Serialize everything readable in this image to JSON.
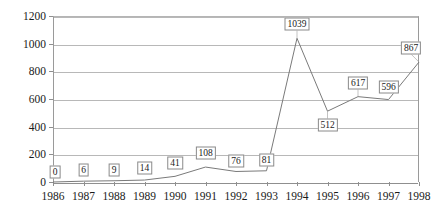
{
  "chart_data": {
    "type": "line",
    "title": "",
    "xlabel": "",
    "ylabel": "Number of Articles",
    "categories": [
      "1986",
      "1987",
      "1988",
      "1989",
      "1990",
      "1991",
      "1992",
      "1993",
      "1994",
      "1995",
      "1996",
      "1997",
      "1998"
    ],
    "values": [
      0,
      6,
      9,
      14,
      41,
      108,
      76,
      81,
      1039,
      512,
      617,
      596,
      867
    ],
    "value_labels": [
      "0",
      "6",
      "9",
      "14",
      "41",
      "108",
      "76",
      "81",
      "1039",
      "512",
      "617",
      "596",
      "867"
    ],
    "ylim": [
      0,
      1200
    ],
    "ytick_values": [
      0,
      200,
      400,
      600,
      800,
      1000,
      1200
    ],
    "ytick_labels": [
      "0",
      "200",
      "400",
      "600",
      "800",
      "1000",
      "1200"
    ],
    "grid": true,
    "legend": false,
    "series_color": "#7a7a7a",
    "grid_color": "#b8b8b8",
    "axis_color": "#8f8f8f",
    "text_color": "#1a1a1a",
    "background": "#ffffff"
  }
}
